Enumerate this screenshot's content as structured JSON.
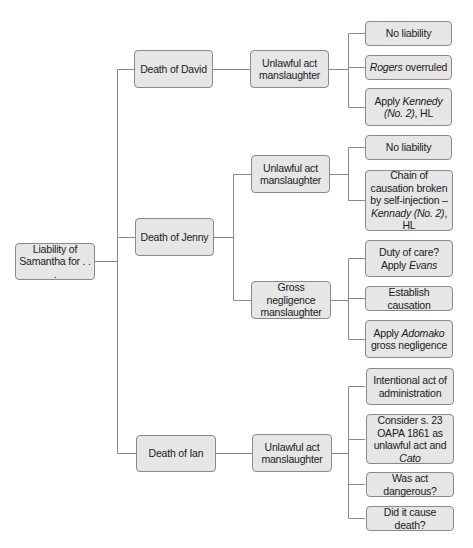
{
  "diagram": {
    "type": "tree",
    "root": {
      "label": "Liability of Samantha for . . ."
    },
    "branches": [
      {
        "label": "Death of David",
        "children": [
          {
            "label": "Unlawful act manslaughter",
            "children": [
              {
                "parts": [
                  {
                    "t": "No liability"
                  }
                ]
              },
              {
                "parts": [
                  {
                    "t": "Rogers",
                    "i": true
                  },
                  {
                    "t": " overruled"
                  }
                ]
              },
              {
                "parts": [
                  {
                    "t": "Apply "
                  },
                  {
                    "t": "Kennedy (No. 2)",
                    "i": true
                  },
                  {
                    "t": ", HL"
                  }
                ]
              }
            ]
          }
        ]
      },
      {
        "label": "Death of Jenny",
        "children": [
          {
            "label": "Unlawful act manslaughter",
            "children": [
              {
                "parts": [
                  {
                    "t": "No liability"
                  }
                ]
              },
              {
                "parts": [
                  {
                    "t": "Chain of causation broken by self-injection – "
                  },
                  {
                    "t": "Kennady (No. 2)",
                    "i": true
                  },
                  {
                    "t": ", HL"
                  }
                ]
              }
            ]
          },
          {
            "label": "Gross negligence manslaughter",
            "children": [
              {
                "parts": [
                  {
                    "t": "Duty of care? Apply "
                  },
                  {
                    "t": "Evans",
                    "i": true
                  }
                ]
              },
              {
                "parts": [
                  {
                    "t": "Establish causation"
                  }
                ]
              },
              {
                "parts": [
                  {
                    "t": "Apply "
                  },
                  {
                    "t": "Adomako",
                    "i": true
                  },
                  {
                    "t": " gross negligence"
                  }
                ]
              }
            ]
          }
        ]
      },
      {
        "label": "Death of Ian",
        "children": [
          {
            "label": "Unlawful act manslaughter",
            "children": [
              {
                "parts": [
                  {
                    "t": "Intentional act of administration"
                  }
                ]
              },
              {
                "parts": [
                  {
                    "t": "Consider s. 23 OAPA 1861 as unlawful act and "
                  },
                  {
                    "t": "Cato",
                    "i": true
                  }
                ]
              },
              {
                "parts": [
                  {
                    "t": "Was act dangerous?"
                  }
                ]
              },
              {
                "parts": [
                  {
                    "t": "Did it cause death?"
                  }
                ]
              }
            ]
          }
        ]
      }
    ]
  },
  "colors": {
    "node_fill": "#e6e6e6",
    "node_border": "#8a8a8a",
    "line": "#8a8a8a",
    "text": "#1a1a1a"
  }
}
